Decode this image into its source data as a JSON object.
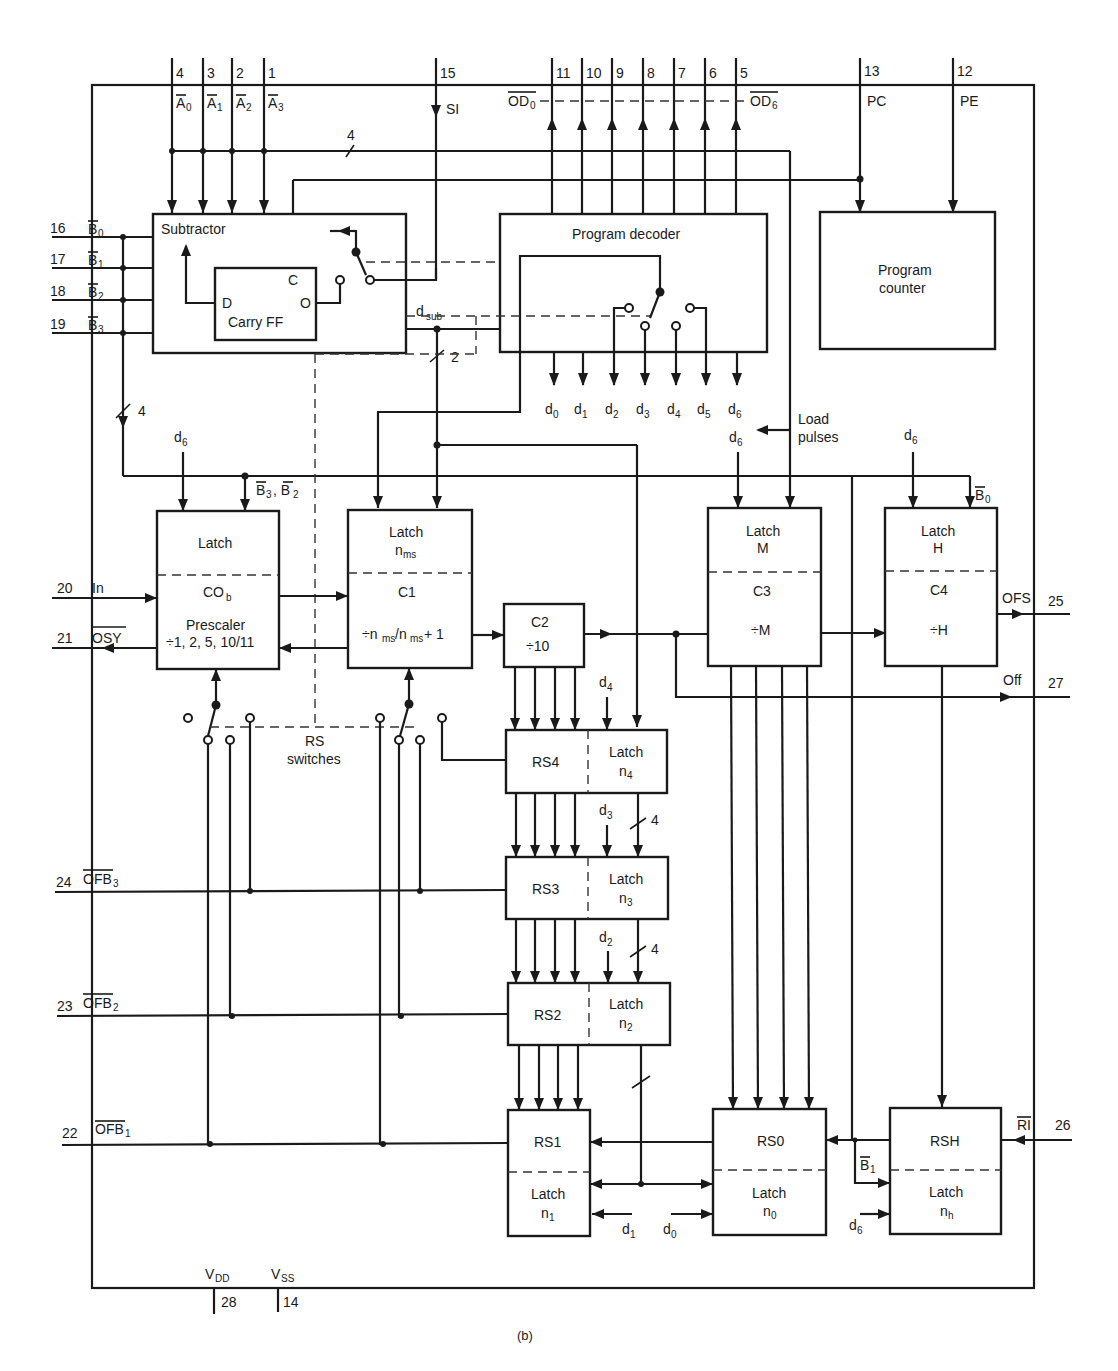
{
  "figure": {
    "caption": "(b)",
    "colors": {
      "ink": "#1a1a1a",
      "background": "#ffffff"
    }
  },
  "pins": {
    "top": [
      {
        "num": "4",
        "signal": "A0",
        "bar": true
      },
      {
        "num": "3",
        "signal": "A1",
        "bar": true
      },
      {
        "num": "2",
        "signal": "A2",
        "bar": true
      },
      {
        "num": "1",
        "signal": "A3",
        "bar": true
      },
      {
        "num": "15",
        "signal": "SI",
        "bar": false
      },
      {
        "num": "11",
        "signal": "OD0",
        "bar": true
      },
      {
        "num": "10",
        "signal": "",
        "bar": false
      },
      {
        "num": "9",
        "signal": "",
        "bar": false
      },
      {
        "num": "8",
        "signal": "",
        "bar": false
      },
      {
        "num": "7",
        "signal": "",
        "bar": false
      },
      {
        "num": "6",
        "signal": "",
        "bar": false
      },
      {
        "num": "5",
        "signal": "OD6",
        "bar": true
      },
      {
        "num": "13",
        "signal": "PC",
        "bar": false
      },
      {
        "num": "12",
        "signal": "PE",
        "bar": false
      }
    ],
    "left": [
      {
        "num": "16",
        "signal": "B0",
        "bar": true
      },
      {
        "num": "17",
        "signal": "B1",
        "bar": true
      },
      {
        "num": "18",
        "signal": "B2",
        "bar": true
      },
      {
        "num": "19",
        "signal": "B3",
        "bar": true
      },
      {
        "num": "20",
        "signal": "In",
        "bar": false
      },
      {
        "num": "21",
        "signal": "OSY",
        "bar": true
      },
      {
        "num": "24",
        "signal": "OFB3",
        "bar": true
      },
      {
        "num": "23",
        "signal": "OFB2",
        "bar": true
      },
      {
        "num": "22",
        "signal": "OFB1",
        "bar": true
      }
    ],
    "right": [
      {
        "num": "25",
        "signal": "OFS",
        "bar": false
      },
      {
        "num": "27",
        "signal": "Off",
        "bar": false
      },
      {
        "num": "26",
        "signal": "RI",
        "bar": true
      }
    ],
    "bottom": [
      {
        "num": "28",
        "signal": "VDD"
      },
      {
        "num": "14",
        "signal": "VSS"
      }
    ]
  },
  "blocks": {
    "subtractor": {
      "title": "Subtractor",
      "inner_title": "Carry FF",
      "inputs": [
        "D",
        "C"
      ],
      "output": "O",
      "out_label": "d",
      "out_sub": "sub"
    },
    "program_decoder": {
      "title": "Program decoder",
      "outputs": [
        "d0",
        "d1",
        "d2",
        "d3",
        "d4",
        "d5",
        "d6"
      ]
    },
    "program_counter": {
      "line1": "Program",
      "line2": "counter"
    },
    "prescaler": {
      "top": "Latch",
      "mid": "CO",
      "mid_sub": "b",
      "line1": "Prescaler",
      "line2": "÷1, 2, 5, 10/11",
      "input_label": "d6",
      "bus_label": "B3, B2"
    },
    "c1": {
      "top": "Latch",
      "top_sub": "n",
      "top_subsub": "ms",
      "mid": "C1",
      "formula": "÷n/n + 1"
    },
    "c2": {
      "line1": "C2",
      "line2": "÷10"
    },
    "c3": {
      "top": "Latch",
      "top2": "M",
      "mid": "C3",
      "formula": "÷M",
      "input_label": "d6"
    },
    "c4": {
      "top": "Latch",
      "top2": "H",
      "mid": "C4",
      "formula": "÷H",
      "input_label": "d6",
      "bus_label": "B0"
    },
    "rs4": {
      "left": "RS4",
      "right": "Latch",
      "right_sub": "n4",
      "input_label": "d4"
    },
    "rs3": {
      "left": "RS3",
      "right": "Latch",
      "right_sub": "n3",
      "input_label": "d3",
      "bus_width": "4"
    },
    "rs2": {
      "left": "RS2",
      "right": "Latch",
      "right_sub": "n2",
      "input_label": "d2",
      "bus_width": "4"
    },
    "rs1": {
      "top": "RS1",
      "bottom": "Latch",
      "bottom_sub": "n1",
      "input_label": "d1"
    },
    "rs0": {
      "top": "RS0",
      "bottom": "Latch",
      "bottom_sub": "n0",
      "input_label": "d0"
    },
    "rsh": {
      "top": "RSH",
      "bottom": "Latch",
      "bottom_sub": "nh",
      "input_label": "d6",
      "bus_label": "B1"
    }
  },
  "annotations": {
    "bus_4": "4",
    "bus_2": "2",
    "bus_4_left": "4",
    "load_pulses_1": "Load",
    "load_pulses_2": "pulses",
    "load_d6": "d6",
    "rs_switches_1": "RS",
    "rs_switches_2": "switches"
  }
}
